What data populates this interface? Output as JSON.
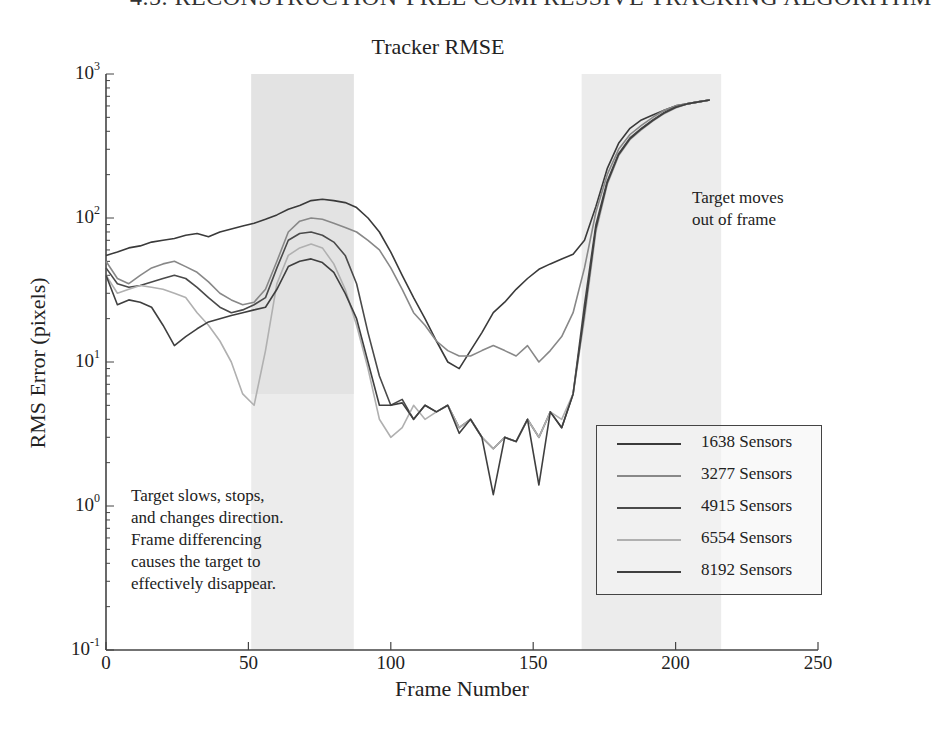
{
  "header": {
    "running_head": "4.5. RECONSTRUCTION-FREE COMPRESSIVE TRACKING ALGORITHM"
  },
  "chart_data": {
    "type": "line",
    "title": "Tracker RMSE",
    "xlabel": "Frame Number",
    "ylabel": "RMS Error (pixels)",
    "xlim": [
      0,
      250
    ],
    "ylim": [
      0.1,
      1000
    ],
    "yscale": "log",
    "x_ticks": [
      0,
      50,
      100,
      150,
      200,
      250
    ],
    "y_ticks": [
      {
        "base": "10",
        "exp": "3",
        "value": 1000
      },
      {
        "base": "10",
        "exp": "2",
        "value": 100
      },
      {
        "base": "10",
        "exp": "1",
        "value": 10
      },
      {
        "base": "10",
        "exp": "0",
        "value": 1
      },
      {
        "base": "10",
        "exp": "-1",
        "value": 0.1
      }
    ],
    "grid": false,
    "legend_position": "lower right",
    "shaded_regions": [
      {
        "x_start": 51,
        "x_end": 87,
        "label": "Target slows, stops, and changes direction."
      },
      {
        "x_start": 167,
        "x_end": 216,
        "label": "Target moves out of frame"
      }
    ],
    "annotations": [
      {
        "text_lines": [
          "Target slows, stops,",
          "and changes direction.",
          "Frame differencing",
          "causes the target to",
          "effectively disappear."
        ]
      },
      {
        "text_lines": [
          "Target moves",
          "out of frame"
        ]
      }
    ],
    "x": [
      0,
      4,
      8,
      12,
      16,
      20,
      24,
      28,
      32,
      36,
      40,
      44,
      48,
      52,
      56,
      60,
      64,
      68,
      72,
      76,
      80,
      84,
      88,
      92,
      96,
      100,
      104,
      108,
      112,
      116,
      120,
      124,
      128,
      132,
      136,
      140,
      144,
      148,
      152,
      156,
      160,
      164,
      168,
      172,
      176,
      180,
      184,
      188,
      192,
      196,
      200,
      204,
      208,
      212
    ],
    "series": [
      {
        "name": "1638 Sensors",
        "color": "#3a3a3a",
        "values": [
          55,
          58,
          62,
          64,
          68,
          70,
          72,
          76,
          78,
          74,
          80,
          84,
          88,
          92,
          98,
          105,
          115,
          122,
          132,
          135,
          132,
          128,
          118,
          100,
          80,
          58,
          40,
          28,
          20,
          14,
          10,
          9,
          12,
          16,
          22,
          26,
          32,
          38,
          44,
          48,
          52,
          56,
          70,
          120,
          220,
          330,
          420,
          480,
          520,
          560,
          600,
          620,
          640,
          660
        ]
      },
      {
        "name": "3277 Sensors",
        "color": "#888888",
        "values": [
          50,
          38,
          35,
          40,
          45,
          48,
          50,
          46,
          42,
          36,
          30,
          27,
          25,
          26,
          32,
          50,
          80,
          95,
          100,
          98,
          92,
          86,
          80,
          70,
          60,
          45,
          32,
          22,
          18,
          14,
          12,
          11,
          11,
          12,
          13,
          12,
          11,
          13,
          10,
          12,
          15,
          22,
          45,
          110,
          200,
          300,
          380,
          440,
          500,
          560,
          600,
          620,
          640,
          660
        ]
      },
      {
        "name": "4915 Sensors",
        "color": "#4a4a4a",
        "values": [
          45,
          35,
          33,
          34,
          36,
          38,
          40,
          38,
          33,
          28,
          24,
          22,
          23,
          25,
          28,
          45,
          70,
          78,
          80,
          76,
          68,
          55,
          35,
          16,
          8,
          5,
          5.5,
          4,
          5,
          4.5,
          5,
          3.5,
          4,
          3,
          2.5,
          3,
          2.8,
          4,
          3,
          4.5,
          3.5,
          6,
          25,
          90,
          180,
          280,
          360,
          420,
          480,
          540,
          590,
          620,
          640,
          660
        ]
      },
      {
        "name": "6554 Sensors",
        "color": "#b0b0b0",
        "values": [
          40,
          30,
          32,
          34,
          33,
          32,
          30,
          28,
          22,
          18,
          14,
          10,
          6,
          5,
          12,
          35,
          55,
          62,
          66,
          62,
          48,
          32,
          18,
          9,
          4,
          3,
          3.5,
          5,
          4,
          4.5,
          5,
          3.5,
          4,
          3,
          2.5,
          3,
          2.8,
          4,
          3,
          4.5,
          4,
          6,
          20,
          80,
          170,
          270,
          350,
          410,
          470,
          530,
          580,
          620,
          640,
          660
        ]
      },
      {
        "name": "8192 Sensors",
        "color": "#3f3f3f",
        "values": [
          40,
          25,
          27,
          26,
          24,
          18,
          13,
          15,
          17,
          19,
          20,
          21,
          22,
          23,
          24,
          32,
          46,
          50,
          52,
          49,
          42,
          30,
          20,
          10,
          5,
          5,
          5.2,
          4,
          5,
          4.5,
          5,
          3.2,
          4,
          3,
          1.2,
          3,
          2.8,
          4,
          1.4,
          4.5,
          3.5,
          6,
          22,
          85,
          175,
          275,
          355,
          415,
          475,
          535,
          585,
          620,
          640,
          660
        ]
      }
    ]
  },
  "legend": {
    "items": [
      {
        "label": "1638 Sensors",
        "color": "#3a3a3a"
      },
      {
        "label": "3277 Sensors",
        "color": "#888888"
      },
      {
        "label": "4915 Sensors",
        "color": "#4a4a4a"
      },
      {
        "label": "6554 Sensors",
        "color": "#b0b0b0"
      },
      {
        "label": "8192 Sensors",
        "color": "#3f3f3f"
      }
    ]
  },
  "annotations": {
    "left_lines": [
      "Target slows, stops,",
      "and changes direction.",
      "Frame differencing",
      "causes the target to",
      "effectively disappear."
    ],
    "right_lines": [
      "Target moves",
      "out of frame"
    ]
  },
  "axis": {
    "x_ticks": [
      "0",
      "50",
      "100",
      "150",
      "200",
      "250"
    ],
    "y_ticks": [
      {
        "base": "10",
        "exp": "3"
      },
      {
        "base": "10",
        "exp": "2"
      },
      {
        "base": "10",
        "exp": "1"
      },
      {
        "base": "10",
        "exp": "0"
      },
      {
        "base": "10",
        "exp": "-1"
      }
    ]
  },
  "colors": {
    "axis": "#444444",
    "shade": "#ececec",
    "shade_dark": "#e3e3e3"
  }
}
